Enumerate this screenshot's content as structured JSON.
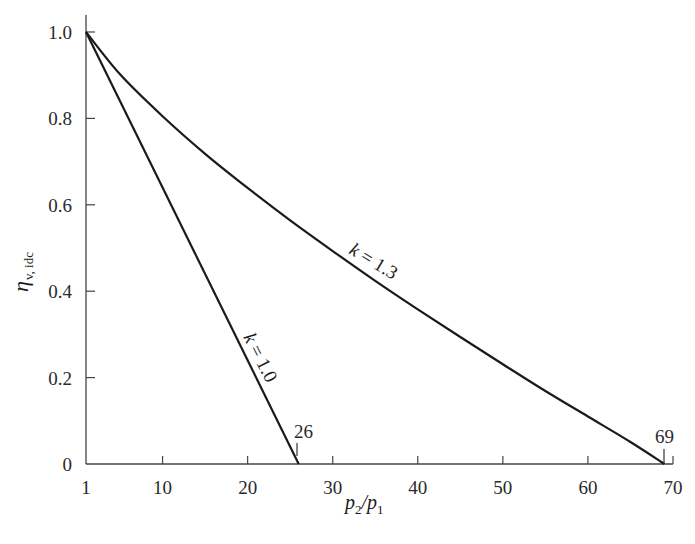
{
  "chart_data": {
    "type": "line",
    "title": "",
    "xlabel": "p2/p1",
    "ylabel": "η v, idc",
    "xlim": [
      1,
      70
    ],
    "ylim": [
      0,
      1.0
    ],
    "grid": false,
    "x_ticks": [
      1,
      10,
      20,
      30,
      40,
      50,
      60,
      70
    ],
    "y_ticks": [
      0,
      0.2,
      0.4,
      0.6,
      0.8,
      1.0
    ],
    "y_tick_labels": [
      "0",
      "0.2",
      "0.4",
      "0.6",
      "0.8",
      "1.0"
    ],
    "series": [
      {
        "name": "k = 1.0",
        "x": [
          1,
          26
        ],
        "values": [
          1.0,
          0.0
        ]
      },
      {
        "name": "k = 1.3",
        "x": [
          1,
          5,
          10,
          15,
          20,
          25,
          30,
          35,
          40,
          45,
          50,
          55,
          60,
          65,
          69
        ],
        "values": [
          1.0,
          0.902,
          0.805,
          0.718,
          0.639,
          0.564,
          0.493,
          0.424,
          0.358,
          0.294,
          0.231,
          0.169,
          0.11,
          0.051,
          0.0
        ]
      }
    ],
    "annotations": [
      {
        "text": "26",
        "x": 26,
        "y": 0
      },
      {
        "text": "69",
        "x": 69,
        "y": 0
      },
      {
        "text": "k = 1.0",
        "series": "k = 1.0"
      },
      {
        "text": "k = 1.3",
        "series": "k = 1.3"
      }
    ]
  },
  "labels": {
    "xlabel_p": "p",
    "xlabel_sub2": "2",
    "xlabel_slash": "/p",
    "xlabel_sub1": "1",
    "ylabel_eta": "η",
    "ylabel_sub": "v, idc",
    "k10": "k = 1.0",
    "k13": "k = 1.3",
    "mark26": "26",
    "mark69": "69"
  }
}
